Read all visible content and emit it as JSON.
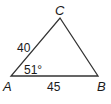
{
  "diagram": {
    "type": "triangle",
    "vertices": {
      "A": {
        "label": "A",
        "x": 11,
        "y": 76
      },
      "B": {
        "label": "B",
        "x": 98,
        "y": 76
      },
      "C": {
        "label": "C",
        "x": 60,
        "y": 18
      }
    },
    "sides": {
      "AC": {
        "label": "40"
      },
      "AB": {
        "label": "45"
      }
    },
    "angles": {
      "A": {
        "label": "51°"
      }
    },
    "stroke_color": "#333333"
  }
}
